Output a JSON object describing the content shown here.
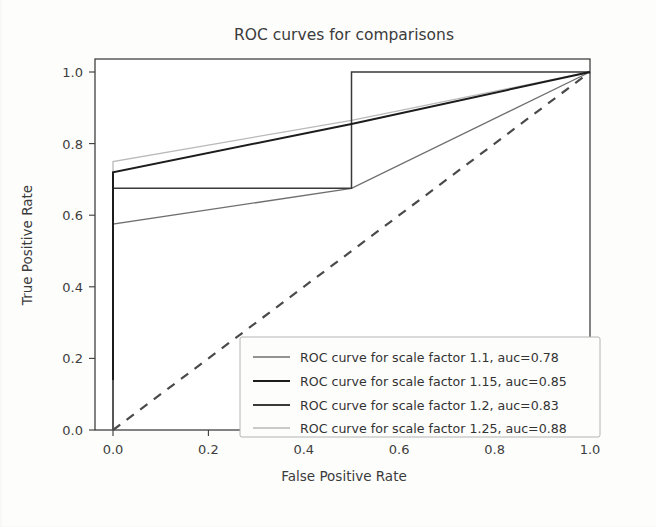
{
  "figure": {
    "title": "ROC curves for comparisons",
    "background_color": "#fdfdfc"
  },
  "axes": {
    "xlabel": "False Positive Rate",
    "ylabel": "True Positive Rate",
    "xticks": [
      "0.0",
      "0.2",
      "0.4",
      "0.6",
      "0.8",
      "1.0"
    ],
    "yticks": [
      "0.0",
      "0.2",
      "0.4",
      "0.6",
      "0.8",
      "1.0"
    ]
  },
  "legend": {
    "entries": [
      {
        "label": "ROC curve for scale factor 1.1, auc=0.78",
        "color": "#6f6f6f",
        "width": 1.3
      },
      {
        "label": "ROC curve for scale factor 1.15, auc=0.85",
        "color": "#1c1c1c",
        "width": 2.0
      },
      {
        "label": "ROC curve for scale factor 1.2, auc=0.83",
        "color": "#3a3a3a",
        "width": 1.5
      },
      {
        "label": "ROC curve for scale factor 1.25, auc=0.88",
        "color": "#b9b9b9",
        "width": 1.3
      }
    ]
  },
  "chart_data": {
    "type": "line",
    "title": "ROC curves for comparisons",
    "xlabel": "False Positive Rate",
    "ylabel": "True Positive Rate",
    "xlim": [
      0.0,
      1.0
    ],
    "ylim": [
      0.0,
      1.0
    ],
    "grid": false,
    "legend_position": "lower right",
    "series": [
      {
        "name": "ROC curve for scale factor 1.1, auc=0.78",
        "auc": 0.78,
        "scale_factor": 1.1,
        "color": "#6f6f6f",
        "linestyle": "solid",
        "x": [
          0.0,
          0.0,
          0.5,
          1.0
        ],
        "y": [
          0.0,
          0.575,
          0.675,
          1.0
        ]
      },
      {
        "name": "ROC curve for scale factor 1.15, auc=0.85",
        "auc": 0.85,
        "scale_factor": 1.15,
        "color": "#1c1c1c",
        "linestyle": "solid",
        "x": [
          0.0,
          0.0,
          0.5,
          1.0
        ],
        "y": [
          0.14,
          0.72,
          0.855,
          1.0
        ]
      },
      {
        "name": "ROC curve for scale factor 1.2, auc=0.83",
        "auc": 0.83,
        "scale_factor": 1.2,
        "color": "#3a3a3a",
        "linestyle": "solid",
        "x": [
          0.0,
          0.0,
          0.5,
          0.5,
          1.0
        ],
        "y": [
          0.0,
          0.675,
          0.675,
          1.0,
          1.0
        ]
      },
      {
        "name": "ROC curve for scale factor 1.25, auc=0.88",
        "auc": 0.88,
        "scale_factor": 1.25,
        "color": "#b9b9b9",
        "linestyle": "solid",
        "x": [
          0.0,
          0.0,
          0.5,
          1.0
        ],
        "y": [
          0.0,
          0.75,
          0.865,
          1.0
        ]
      },
      {
        "name": "chance",
        "color": "#4a4a4a",
        "linestyle": "dashed",
        "x": [
          0.0,
          1.0
        ],
        "y": [
          0.0,
          1.0
        ]
      }
    ]
  }
}
